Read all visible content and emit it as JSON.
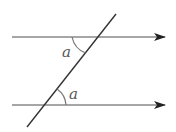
{
  "diagram": {
    "colors": {
      "line": "#888888",
      "transversal": "#333333",
      "arrow": "#222222",
      "arc": "#777777",
      "label": "#555555"
    },
    "parallel_lines": [
      {
        "id": "top-line",
        "x1": 12,
        "y1": 37,
        "x2": 165,
        "y2": 37
      },
      {
        "id": "bottom-line",
        "x1": 12,
        "y1": 105,
        "x2": 165,
        "y2": 105
      }
    ],
    "transversal": {
      "x1": 116,
      "y1": 14,
      "x2": 27,
      "y2": 127
    },
    "angles": [
      {
        "id": "angle-top",
        "label": "a",
        "label_x": 62,
        "label_y": 57
      },
      {
        "id": "angle-bottom",
        "label": "a",
        "label_x": 69,
        "label_y": 99
      }
    ]
  }
}
